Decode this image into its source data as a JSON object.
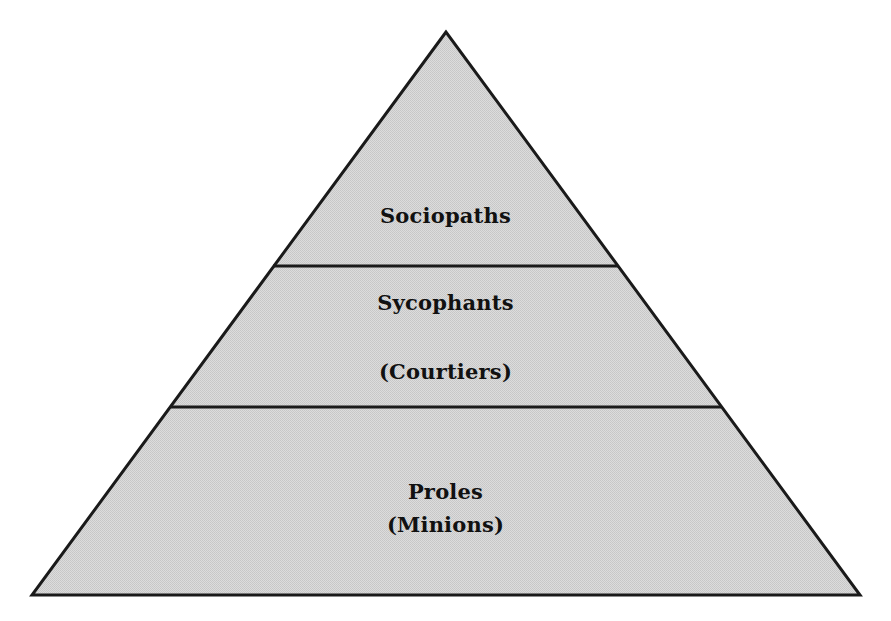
{
  "diagram": {
    "type": "pyramid",
    "colors": {
      "fill": "#d6d6d6",
      "fill_dot": "#c4c4c4",
      "stroke": "#1a1a1a",
      "text": "#111111"
    },
    "geometry": {
      "apex": [
        446,
        32
      ],
      "base_left": [
        32,
        595
      ],
      "base_right": [
        860,
        595
      ],
      "divider_1": {
        "y": 266,
        "x1": 273,
        "x2": 618
      },
      "divider_2": {
        "y": 407,
        "x1": 171,
        "x2": 721
      }
    },
    "tiers": [
      {
        "level": "top",
        "label": "Sociopaths",
        "sublabel": null
      },
      {
        "level": "middle",
        "label": "Sycophants",
        "sublabel": "(Courtiers)"
      },
      {
        "level": "bottom",
        "label": "Proles",
        "sublabel": "(Minions)"
      }
    ]
  }
}
